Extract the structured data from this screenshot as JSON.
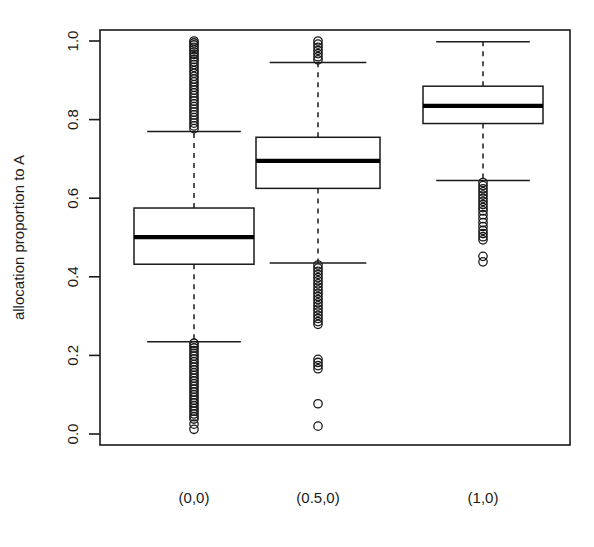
{
  "chart_data": {
    "type": "boxplot",
    "title": "",
    "xlabel": "",
    "ylabel": "allocation proportion to A",
    "ylim": [
      0.0,
      1.0
    ],
    "grid": false,
    "legend": null,
    "categories": [
      "(0,0)",
      "(0.5,0)",
      "(1,0)"
    ],
    "ytick_labels": [
      "0.0",
      "0.2",
      "0.4",
      "0.6",
      "0.8",
      "1.0"
    ],
    "ytick_values": [
      0.0,
      0.2,
      0.4,
      0.6,
      0.8,
      1.0
    ],
    "boxes": [
      {
        "category": "(0,0)",
        "whisker_low": 0.235,
        "q1": 0.432,
        "median": 0.501,
        "q3": 0.575,
        "whisker_high": 0.77,
        "outliers_high": [
          1.0,
          0.995,
          0.99,
          0.984,
          0.978,
          0.972,
          0.966,
          0.96,
          0.953,
          0.947,
          0.94,
          0.933,
          0.925,
          0.918,
          0.91,
          0.903,
          0.896,
          0.889,
          0.882,
          0.875,
          0.868,
          0.861,
          0.854,
          0.847,
          0.84,
          0.833,
          0.826,
          0.819,
          0.812,
          0.805,
          0.798,
          0.791,
          0.784,
          0.777
        ],
        "outliers_low": [
          0.231,
          0.225,
          0.219,
          0.212,
          0.205,
          0.198,
          0.191,
          0.184,
          0.177,
          0.17,
          0.163,
          0.156,
          0.149,
          0.142,
          0.135,
          0.128,
          0.121,
          0.114,
          0.107,
          0.1,
          0.093,
          0.086,
          0.079,
          0.072,
          0.065,
          0.058,
          0.051,
          0.044,
          0.038,
          0.025,
          0.012
        ]
      },
      {
        "category": "(0.5,0)",
        "whisker_low": 0.435,
        "q1": 0.625,
        "median": 0.695,
        "q3": 0.755,
        "whisker_high": 0.945,
        "outliers_high": [
          1.0,
          0.992,
          0.984,
          0.976,
          0.968,
          0.96,
          0.952
        ],
        "outliers_low": [
          0.43,
          0.422,
          0.414,
          0.406,
          0.398,
          0.39,
          0.382,
          0.374,
          0.366,
          0.358,
          0.35,
          0.342,
          0.334,
          0.326,
          0.318,
          0.31,
          0.302,
          0.294,
          0.286,
          0.279,
          0.19,
          0.182,
          0.174,
          0.166,
          0.077,
          0.02
        ]
      },
      {
        "category": "(1,0)",
        "whisker_low": 0.645,
        "q1": 0.79,
        "median": 0.835,
        "q3": 0.885,
        "whisker_high": 0.998,
        "outliers_high": [],
        "outliers_low": [
          0.64,
          0.632,
          0.624,
          0.616,
          0.608,
          0.6,
          0.592,
          0.584,
          0.576,
          0.568,
          0.558,
          0.548,
          0.538,
          0.528,
          0.518,
          0.51,
          0.502,
          0.494,
          0.452,
          0.438
        ]
      }
    ]
  }
}
